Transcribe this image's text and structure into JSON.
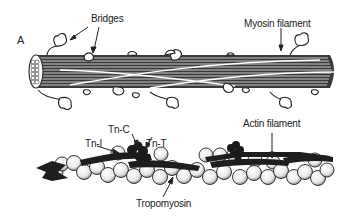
{
  "figure": {
    "panel_label": "A",
    "labels": {
      "bridges": "Bridges",
      "myosin_filament": "Myosin filament",
      "actin_filament": "Actin filament",
      "tn_c": "Tn-C",
      "tn_i": "Tn-I",
      "tn_t": "Tn-T",
      "tropomyosin": "Tropomyosin"
    }
  }
}
